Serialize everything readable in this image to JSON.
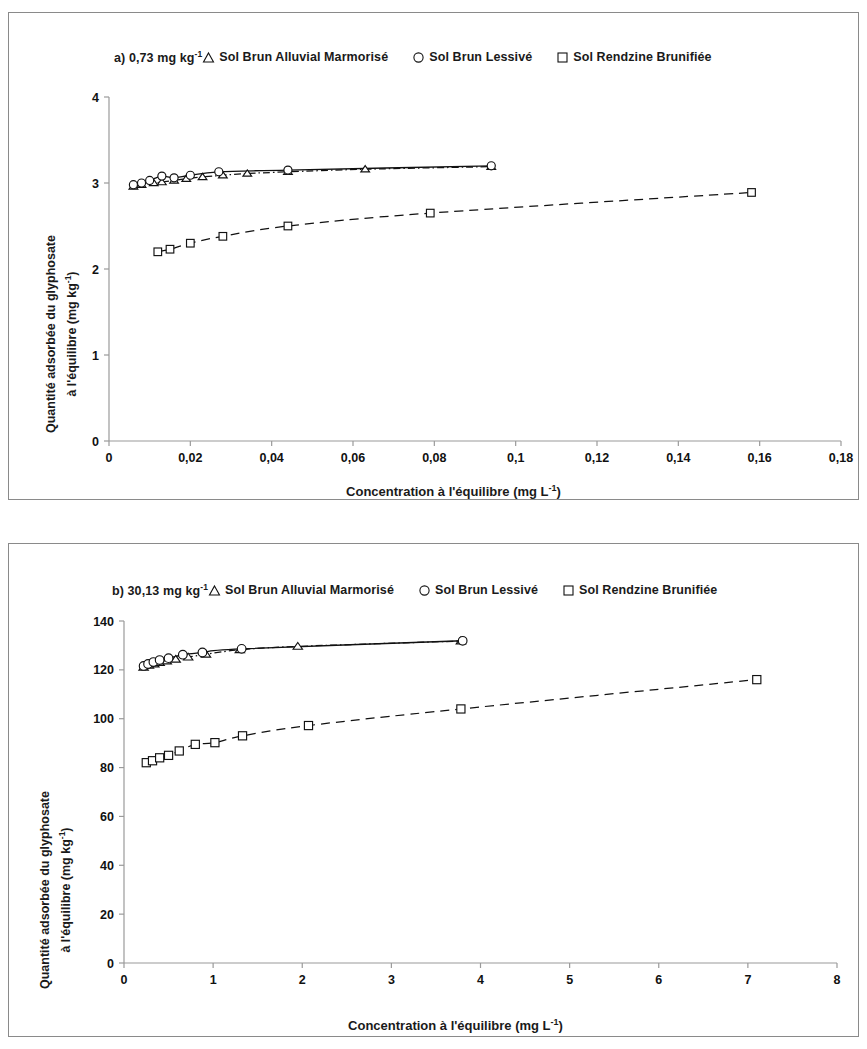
{
  "figure": {
    "background": "#ffffff",
    "panel_border_color": "#8a8a8a"
  },
  "axis_titles": {
    "x": "Concentration à l'équilibre (mg L",
    "x_sup": "-1",
    "x_close": ")",
    "y_line1": "Quantité adsorbée du glyphosate",
    "y_line2": "à l'équilibre (mg kg",
    "y_sup": "-1",
    "y_close": ")"
  },
  "legend": {
    "series": [
      {
        "key": "sbam",
        "marker": "triangle-open-icon",
        "label": "Sol Brun Alluvial Marmorisé"
      },
      {
        "key": "sbl",
        "marker": "circle-open-icon",
        "label": "Sol Brun Lessivé"
      },
      {
        "key": "srb",
        "marker": "square-open-icon",
        "label": "Sol Rendzine Brunifiée"
      }
    ]
  },
  "panels": [
    {
      "id": "a",
      "tag": "a) 0,73 mg kg",
      "tag_sup": "-1"
    },
    {
      "id": "b",
      "tag": "b) 30,13 mg kg",
      "tag_sup": "-1"
    }
  ],
  "chart_data": [
    {
      "panel": "a",
      "type": "scatter",
      "title": "a) 0,73 mg kg-1",
      "xlabel": "Concentration à l'équilibre (mg L-1)",
      "ylabel": "Quantité adsorbée du glyphosate à l'équilibre (mg kg-1)",
      "xlim": [
        0,
        0.18
      ],
      "ylim": [
        0,
        4
      ],
      "xticks": [
        "0",
        "0,02",
        "0,04",
        "0,06",
        "0,08",
        "0,1",
        "0,12",
        "0,14",
        "0,16",
        "0,18"
      ],
      "xtick_values": [
        0,
        0.02,
        0.04,
        0.06,
        0.08,
        0.1,
        0.12,
        0.14,
        0.16,
        0.18
      ],
      "yticks": [
        "0",
        "1",
        "2",
        "3",
        "4"
      ],
      "ytick_values": [
        0,
        1,
        2,
        3,
        4
      ],
      "grid": false,
      "legend_position": "top",
      "series": [
        {
          "name": "Sol Brun Alluvial Marmorisé",
          "marker": "triangle-open-icon",
          "line": "dashdot",
          "x": [
            0.006,
            0.008,
            0.011,
            0.013,
            0.016,
            0.019,
            0.023,
            0.028,
            0.034,
            0.044,
            0.063,
            0.094
          ],
          "y": [
            2.96,
            2.98,
            3.0,
            3.01,
            3.03,
            3.05,
            3.07,
            3.09,
            3.11,
            3.13,
            3.16,
            3.19
          ]
        },
        {
          "name": "Sol Brun Lessivé",
          "marker": "circle-open-icon",
          "line": "solid",
          "x": [
            0.006,
            0.008,
            0.01,
            0.013,
            0.016,
            0.02,
            0.027,
            0.044,
            0.094
          ],
          "y": [
            2.98,
            3.0,
            3.03,
            3.08,
            3.06,
            3.09,
            3.13,
            3.15,
            3.2
          ]
        },
        {
          "name": "Sol Rendzine Brunifiée",
          "marker": "square-open-icon",
          "line": "dashed",
          "x": [
            0.012,
            0.015,
            0.02,
            0.028,
            0.044,
            0.079,
            0.158
          ],
          "y": [
            2.2,
            2.23,
            2.3,
            2.38,
            2.5,
            2.65,
            2.89
          ]
        }
      ]
    },
    {
      "panel": "b",
      "type": "scatter",
      "title": "b) 30,13 mg kg-1",
      "xlabel": "Concentration à l'équilibre (mg L-1)",
      "ylabel": "Quantité adsorbée du glyphosate à l'équilibre (mg kg-1)",
      "xlim": [
        0,
        8
      ],
      "ylim": [
        0,
        140
      ],
      "xticks": [
        "0",
        "1",
        "2",
        "3",
        "4",
        "5",
        "6",
        "7",
        "8"
      ],
      "xtick_values": [
        0,
        1,
        2,
        3,
        4,
        5,
        6,
        7,
        8
      ],
      "yticks": [
        "0",
        "20",
        "40",
        "60",
        "80",
        "100",
        "120",
        "140"
      ],
      "ytick_values": [
        0,
        20,
        40,
        60,
        80,
        100,
        120,
        140
      ],
      "grid": false,
      "legend_position": "top",
      "series": [
        {
          "name": "Sol Brun Alluvial Marmorisé",
          "marker": "triangle-open-icon",
          "line": "dashdot",
          "x": [
            0.22,
            0.28,
            0.34,
            0.4,
            0.48,
            0.58,
            0.72,
            0.92,
            1.3,
            1.95,
            3.78
          ],
          "y": [
            121.0,
            121.8,
            122.4,
            123.0,
            123.6,
            124.3,
            125.2,
            126.4,
            128.2,
            129.6,
            131.8
          ]
        },
        {
          "name": "Sol Brun Lessivé",
          "marker": "circle-open-icon",
          "line": "solid",
          "x": [
            0.22,
            0.27,
            0.33,
            0.4,
            0.5,
            0.66,
            0.88,
            1.32,
            3.8
          ],
          "y": [
            121.6,
            122.4,
            123.2,
            124.0,
            124.8,
            126.2,
            127.1,
            128.6,
            131.9
          ]
        },
        {
          "name": "Sol Rendzine Brunifiée",
          "marker": "square-open-icon",
          "line": "dashed",
          "x": [
            0.25,
            0.32,
            0.4,
            0.5,
            0.62,
            0.8,
            1.02,
            1.33,
            2.07,
            3.78,
            7.1
          ],
          "y": [
            82.0,
            82.8,
            84.0,
            85.0,
            86.8,
            89.5,
            90.2,
            93.0,
            97.2,
            104.0,
            116.0
          ]
        }
      ]
    }
  ]
}
